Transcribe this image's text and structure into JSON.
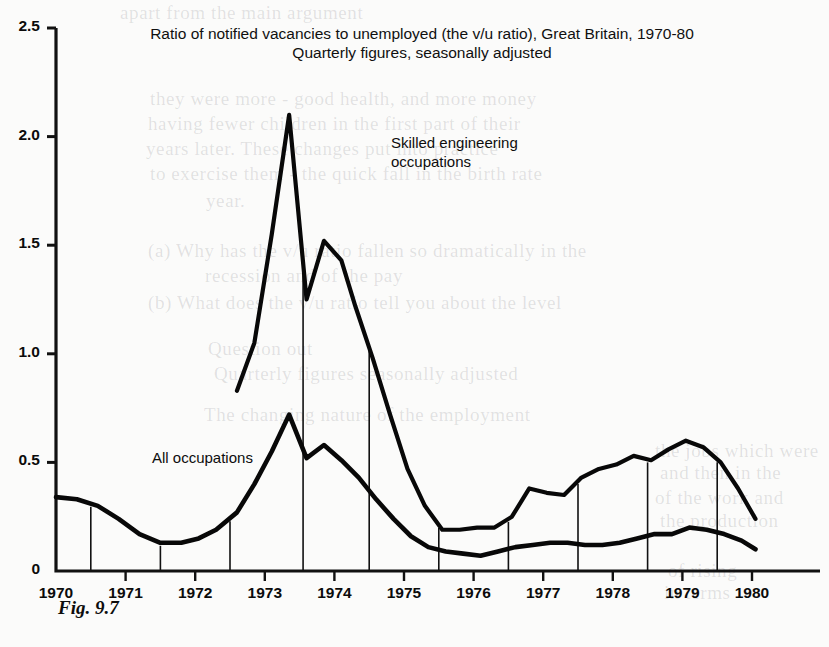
{
  "figure": {
    "caption": "Fig. 9.7"
  },
  "chart_data": {
    "type": "line",
    "title": "Ratio of notified vacancies to unemployed (the v/u ratio), Great Britain, 1970-80",
    "subtitle": "Quarterly figures, seasonally adjusted",
    "xlabel": "",
    "ylabel": "",
    "xlim": [
      1970,
      1980.25
    ],
    "ylim": [
      0,
      2.5
    ],
    "grid": false,
    "legend_position": "inline-annotation",
    "y_ticks": [
      "0",
      "0.5",
      "1.0",
      "1.5",
      "2.0",
      "2.5"
    ],
    "y_tick_values": [
      0,
      0.5,
      1.0,
      1.5,
      2.0,
      2.5
    ],
    "x_ticks": [
      "1970",
      "1971",
      "1972",
      "1973",
      "1974",
      "1975",
      "1976",
      "1977",
      "1978",
      "1979",
      "1980"
    ],
    "x_tick_values": [
      1970,
      1971,
      1972,
      1973,
      1974,
      1975,
      1976,
      1977,
      1978,
      1979,
      1980
    ],
    "series": [
      {
        "name": "Skilled engineering occupations",
        "x": [
          1972.6,
          1972.85,
          1973.1,
          1973.35,
          1973.6,
          1973.85,
          1974.1,
          1974.3,
          1974.55,
          1974.8,
          1975.05,
          1975.3,
          1975.55,
          1975.8,
          1976.05,
          1976.3,
          1976.55,
          1976.8,
          1977.05,
          1977.3,
          1977.55,
          1977.8,
          1978.05,
          1978.3,
          1978.55,
          1978.8,
          1979.05,
          1979.3,
          1979.55,
          1979.8,
          1980.05
        ],
        "values": [
          0.83,
          1.05,
          1.55,
          2.1,
          1.25,
          1.52,
          1.43,
          1.22,
          0.98,
          0.72,
          0.47,
          0.3,
          0.19,
          0.19,
          0.2,
          0.2,
          0.25,
          0.38,
          0.36,
          0.35,
          0.43,
          0.47,
          0.49,
          0.53,
          0.51,
          0.56,
          0.6,
          0.57,
          0.5,
          0.38,
          0.24
        ]
      },
      {
        "name": "All occupations",
        "x": [
          1970.0,
          1970.3,
          1970.6,
          1970.9,
          1971.2,
          1971.5,
          1971.8,
          1972.05,
          1972.3,
          1972.6,
          1972.85,
          1973.1,
          1973.35,
          1973.6,
          1973.85,
          1974.1,
          1974.35,
          1974.6,
          1974.85,
          1975.1,
          1975.35,
          1975.6,
          1975.85,
          1976.1,
          1976.35,
          1976.6,
          1976.85,
          1977.1,
          1977.35,
          1977.6,
          1977.85,
          1978.1,
          1978.35,
          1978.6,
          1978.85,
          1979.1,
          1979.35,
          1979.6,
          1979.85,
          1980.05
        ],
        "values": [
          0.34,
          0.33,
          0.3,
          0.24,
          0.17,
          0.13,
          0.13,
          0.15,
          0.19,
          0.27,
          0.4,
          0.55,
          0.72,
          0.52,
          0.58,
          0.51,
          0.43,
          0.33,
          0.24,
          0.16,
          0.11,
          0.09,
          0.08,
          0.07,
          0.09,
          0.11,
          0.12,
          0.13,
          0.13,
          0.12,
          0.12,
          0.13,
          0.15,
          0.17,
          0.17,
          0.2,
          0.19,
          0.17,
          0.14,
          0.1
        ]
      }
    ],
    "annotations": [
      {
        "name": "skilled-label",
        "text": "Skilled engineering\noccupations"
      },
      {
        "name": "all-occupations-label",
        "text": "All occupations"
      }
    ]
  },
  "bleed_through": [
    {
      "text": "apart from the main argument",
      "x": 120,
      "y": 2
    },
    {
      "text": "they were more - good health, and more money",
      "x": 150,
      "y": 88
    },
    {
      "text": "having fewer children in the first part of their",
      "x": 148,
      "y": 113
    },
    {
      "text": "years later. These changes put into practice",
      "x": 146,
      "y": 138
    },
    {
      "text": "to exercise them - the quick fall in the birth rate",
      "x": 150,
      "y": 163
    },
    {
      "text": "year.",
      "x": 206,
      "y": 190
    },
    {
      "text": "(a) Why has the v/u ratio fallen so dramatically in the",
      "x": 148,
      "y": 240
    },
    {
      "text": "recession and of the pay",
      "x": 205,
      "y": 265
    },
    {
      "text": "(b) What does the v/u ratio tell you about the level",
      "x": 148,
      "y": 292
    },
    {
      "text": "Question out",
      "x": 208,
      "y": 338
    },
    {
      "text": "Quarterly figures seasonally adjusted",
      "x": 214,
      "y": 363
    },
    {
      "text": "The changing nature of the employment",
      "x": 204,
      "y": 404
    },
    {
      "text": "the jobs which were",
      "x": 655,
      "y": 440
    },
    {
      "text": "and then in the",
      "x": 660,
      "y": 462
    },
    {
      "text": "of the work and",
      "x": 655,
      "y": 487
    },
    {
      "text": "the production",
      "x": 660,
      "y": 510
    },
    {
      "text": "of rising",
      "x": 668,
      "y": 560
    },
    {
      "text": "in terms",
      "x": 664,
      "y": 582
    }
  ]
}
